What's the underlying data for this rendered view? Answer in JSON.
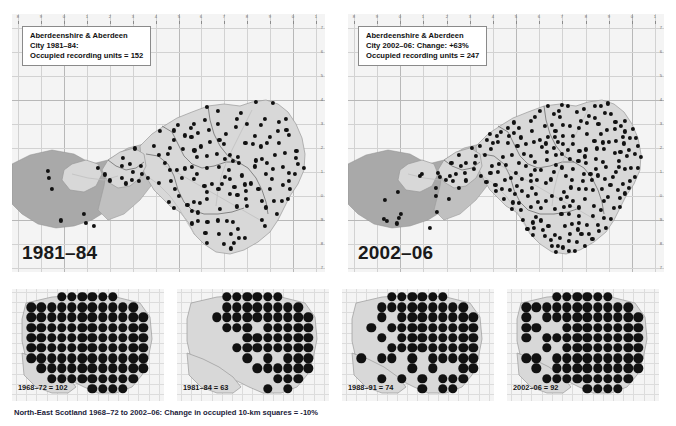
{
  "figure": {
    "title_caption": "North-East Scotland 1968–72 to 2002–06: Change in occupied 10-km squares = -10%"
  },
  "panels": {
    "top_left": {
      "legend": {
        "line1": "Aberdeenshire & Aberdeen",
        "line2": "City 1981–84:",
        "line3_prefix": "Occupied recording units = ",
        "line3_value": "152"
      },
      "year_label": "1981–84",
      "x_ticks": [
        "8",
        "9",
        "0",
        "1",
        "2",
        "3",
        "4",
        "5",
        "6",
        "7",
        "8",
        "9",
        "0",
        "1"
      ],
      "y_ticks": [
        "7",
        "6",
        "5",
        "4",
        "3",
        "2",
        "1",
        "0",
        "9",
        "8",
        "7"
      ]
    },
    "top_right": {
      "legend": {
        "line1": "Aberdeenshire & Aberdeen",
        "line2_prefix": "City 2002–06: Change: ",
        "line2_value": "+63%",
        "line3_prefix": "Occupied recording units = ",
        "line3_value": "247"
      },
      "year_label": "2002–06",
      "x_ticks": [
        "8",
        "9",
        "0",
        "1",
        "2",
        "3",
        "4",
        "5",
        "6",
        "7",
        "8",
        "9",
        "0",
        "1"
      ],
      "y_ticks": [
        "7",
        "6",
        "5",
        "4",
        "3",
        "2",
        "1",
        "0",
        "9",
        "8",
        "7"
      ]
    },
    "bottom": [
      {
        "label": "1968–72 = 102",
        "period": "1968–72",
        "count": "102"
      },
      {
        "label": "1981–84 = 63",
        "period": "1981–84",
        "count": "63"
      },
      {
        "label": "1988–91 = 74",
        "period": "1988–91",
        "count": "74"
      },
      {
        "label": "2002–06 = 92",
        "period": "2002–06",
        "count": "92"
      }
    ]
  },
  "chart_data": {
    "type": "map",
    "title": "North-East Scotland 1968–72 to 2002–06: Change in occupied 10-km squares = -10%",
    "region": "Aberdeenshire & Aberdeen City / North-East Scotland",
    "measure": "Occupied recording units (tetrads) and occupied 10-km squares",
    "legend_position": "top-left inside each main map",
    "grid": true,
    "series": [
      {
        "name": "1981–84 occupied recording units",
        "value": 152,
        "panel": "top_left"
      },
      {
        "name": "2002–06 occupied recording units",
        "value": 247,
        "panel": "top_right",
        "change_pct": 63
      },
      {
        "name": "1968–72 occupied 10-km squares",
        "value": 102,
        "panel": "bottom_1"
      },
      {
        "name": "1981–84 occupied 10-km squares",
        "value": 63,
        "panel": "bottom_2"
      },
      {
        "name": "1988–91 occupied 10-km squares",
        "value": 74,
        "panel": "bottom_3"
      },
      {
        "name": "2002–06 occupied 10-km squares",
        "value": 92,
        "panel": "bottom_4"
      }
    ],
    "overall_change_pct": -10,
    "colors": {
      "dot": "#111111",
      "land": "#d8d8d8",
      "upland": "#a9a9a9",
      "grid": "#d2d2d2",
      "panel_background": "#f4f4f4",
      "caption": "#1b1b3a"
    }
  }
}
